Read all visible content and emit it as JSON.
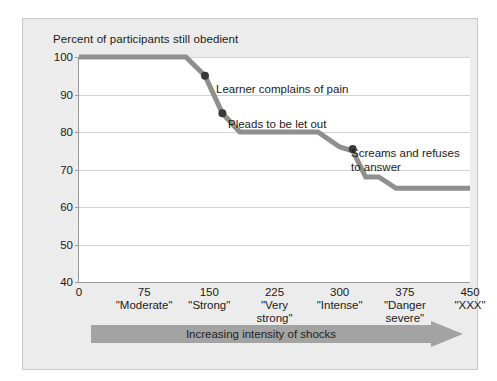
{
  "figure": {
    "background_color": "#ebeceb",
    "plot_background_color": "#ffffff",
    "line_color": "#8f8f8f",
    "marker_color": "#3a3a3a",
    "arrow_color": "#a3a3a3",
    "grid_color": "#d2d2d2"
  },
  "chart_data": {
    "type": "line",
    "title": "Percent of participants still obedient",
    "xlabel": "Increasing intensity of shocks",
    "ylabel": "",
    "xlim": [
      0,
      450
    ],
    "ylim": [
      40,
      100
    ],
    "grid": true,
    "legend": "none",
    "x": [
      0,
      123,
      145,
      165,
      185,
      275,
      300,
      315,
      330,
      345,
      365,
      450
    ],
    "y": [
      100,
      100,
      95,
      85,
      80,
      80,
      76,
      75,
      68,
      68,
      65,
      65
    ],
    "ytick_labels": [
      "100",
      "90",
      "80",
      "70",
      "60",
      "50",
      "40"
    ],
    "ytick_values": [
      100,
      90,
      80,
      70,
      60,
      50,
      40
    ],
    "xtick_values": [
      0,
      75,
      150,
      225,
      300,
      375,
      450
    ],
    "xtick_labels": [
      "0",
      "75",
      "150",
      "225",
      "300",
      "375",
      "450"
    ],
    "xtick_names": [
      "",
      "\"Moderate\"",
      "\"Strong\"",
      "\"Very\nstrong\"",
      "\"Intense\"",
      "\"Danger\nsevere\"",
      "\"XXX\""
    ],
    "markers": [
      {
        "x": 145,
        "y": 95,
        "label": "Learner complains of pain"
      },
      {
        "x": 165,
        "y": 85,
        "label": "Pleads to be let out"
      },
      {
        "x": 315,
        "y": 75.5,
        "label": "Screams and refuses\nto answer"
      }
    ],
    "annotations": [
      {
        "text": "Learner complains of pain",
        "left": 190,
        "top": 69
      },
      {
        "text": "Pleads to be let out",
        "left": 202,
        "top": 104
      },
      {
        "text": "Screams and refuses\nto answer",
        "left": 325,
        "top": 133
      }
    ]
  }
}
